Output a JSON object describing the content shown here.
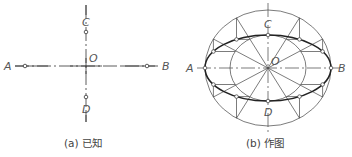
{
  "panels": [
    {
      "id": "a",
      "caption": "(a) 已知",
      "labels": {
        "A": "A",
        "B": "B",
        "C": "C",
        "D": "D",
        "O": "O"
      },
      "description": "Given: major axis AB and minor axis CD intersecting at center O"
    },
    {
      "id": "b",
      "caption": "(b) 作图",
      "labels": {
        "A": "A",
        "B": "B",
        "C": "C",
        "D": "D",
        "O": "O"
      },
      "description": "Construction: ellipse by concentric circles method, 12 radial lines, points marked on ellipse"
    }
  ],
  "colors": {
    "line": "#333333",
    "label": "#555555"
  }
}
